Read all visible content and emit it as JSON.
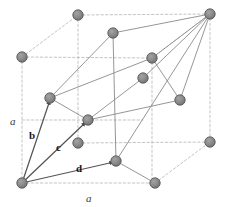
{
  "figure": {
    "type": "crystal-lattice-diagram",
    "background_color": "#ffffff",
    "cube_edge_color": "#b9b9b9",
    "cell_edge_color": "#8a8a8a",
    "vector_color": "#555555",
    "atom_fill_color": "#8a8a8a",
    "atom_edge_color": "#5a5a5a",
    "atom_radius_px": 5.2
  },
  "labels": {
    "vectors": [
      {
        "id": "b",
        "text": "b",
        "x": 29,
        "y": 130
      },
      {
        "id": "c",
        "text": "c",
        "x": 56,
        "y": 142
      },
      {
        "id": "d",
        "text": "d",
        "x": 76,
        "y": 163
      }
    ],
    "axes": [
      {
        "id": "a-left",
        "text": "a",
        "x": 10,
        "y": 116
      },
      {
        "id": "a-bottom",
        "text": "a",
        "x": 86,
        "y": 193
      }
    ]
  },
  "atoms": [
    {
      "id": "corner-back-bottom-left",
      "x": 22,
      "y": 183
    },
    {
      "id": "corner-back-top-left",
      "x": 22,
      "y": 57
    },
    {
      "id": "corner-top-back-mid",
      "x": 78,
      "y": 15
    },
    {
      "id": "corner-top-far-right",
      "x": 210,
      "y": 14
    },
    {
      "id": "corner-right-mid",
      "x": 210,
      "y": 142
    },
    {
      "id": "corner-bottom-front-mid",
      "x": 155,
      "y": 183
    },
    {
      "id": "face-center-upper-left",
      "x": 113,
      "y": 33
    },
    {
      "id": "face-center-upper-right",
      "x": 152,
      "y": 58
    },
    {
      "id": "face-center-mid-right",
      "x": 143,
      "y": 78
    },
    {
      "id": "face-center-left",
      "x": 50,
      "y": 98
    },
    {
      "id": "face-center-core",
      "x": 88,
      "y": 120
    },
    {
      "id": "face-center-inner",
      "x": 78,
      "y": 143
    },
    {
      "id": "face-center-lower-right",
      "x": 180,
      "y": 100
    },
    {
      "id": "face-center-bottom",
      "x": 116,
      "y": 161
    }
  ],
  "cube_edges": [
    {
      "id": "cube-left-vertical",
      "x1": 22,
      "y1": 57,
      "x2": 22,
      "y2": 183
    },
    {
      "id": "cube-left-to-back-top",
      "x1": 22,
      "y1": 57,
      "x2": 78,
      "y2": 15
    },
    {
      "id": "cube-back-top-vertical",
      "x1": 78,
      "y1": 15,
      "x2": 78,
      "y2": 143
    },
    {
      "id": "cube-back-top-to-far-top",
      "x1": 78,
      "y1": 15,
      "x2": 210,
      "y2": 14
    },
    {
      "id": "cube-far-top-vertical",
      "x1": 210,
      "y1": 14,
      "x2": 210,
      "y2": 142
    },
    {
      "id": "cube-left-to-mid-right",
      "x1": 22,
      "y1": 57,
      "x2": 152,
      "y2": 58
    },
    {
      "id": "cube-mid-right-diag",
      "x1": 152,
      "y1": 58,
      "x2": 210,
      "y2": 14
    },
    {
      "id": "cube-mid-right-vertical",
      "x1": 152,
      "y1": 58,
      "x2": 152,
      "y2": 183
    },
    {
      "id": "cube-bottom-front-edge",
      "x1": 22,
      "y1": 183,
      "x2": 155,
      "y2": 183
    },
    {
      "id": "cube-bottom-front-to-right",
      "x1": 155,
      "y1": 183,
      "x2": 210,
      "y2": 142
    },
    {
      "id": "cube-mid-horizontal-right",
      "x1": 78,
      "y1": 143,
      "x2": 210,
      "y2": 142
    },
    {
      "id": "cube-core-horizontal",
      "x1": 22,
      "y1": 120,
      "x2": 143,
      "y2": 120
    }
  ],
  "cell_edges": [
    {
      "id": "cell-b-to-upper-left",
      "x1": 50,
      "y1": 98,
      "x2": 113,
      "y2": 33
    },
    {
      "id": "cell-upper-left-to-top",
      "x1": 113,
      "y1": 33,
      "x2": 210,
      "y2": 14
    },
    {
      "id": "cell-b-to-core",
      "x1": 50,
      "y1": 98,
      "x2": 152,
      "y2": 58
    },
    {
      "id": "cell-core-to-top",
      "x1": 152,
      "y1": 58,
      "x2": 210,
      "y2": 14
    },
    {
      "id": "cell-c-to-midright",
      "x1": 88,
      "y1": 120,
      "x2": 180,
      "y2": 100
    },
    {
      "id": "cell-midright-to-top",
      "x1": 180,
      "y1": 100,
      "x2": 210,
      "y2": 14
    },
    {
      "id": "cell-d-to-bottomfront",
      "x1": 116,
      "y1": 161,
      "x2": 155,
      "y2": 183
    },
    {
      "id": "cell-bottomfront-up",
      "x1": 116,
      "y1": 161,
      "x2": 210,
      "y2": 14
    },
    {
      "id": "cell-upperleft-down",
      "x1": 113,
      "y1": 33,
      "x2": 116,
      "y2": 161
    },
    {
      "id": "cell-core-down",
      "x1": 152,
      "y1": 58,
      "x2": 180,
      "y2": 100
    },
    {
      "id": "cell-inner-link",
      "x1": 88,
      "y1": 120,
      "x2": 143,
      "y2": 78
    },
    {
      "id": "cell-inner-link-2",
      "x1": 143,
      "y1": 78,
      "x2": 210,
      "y2": 14
    },
    {
      "id": "cell-left-drop",
      "x1": 50,
      "y1": 98,
      "x2": 88,
      "y2": 120
    }
  ],
  "vectors": [
    {
      "id": "vector-b",
      "x1": 22,
      "y1": 183,
      "x2": 50,
      "y2": 100
    },
    {
      "id": "vector-c",
      "x1": 22,
      "y1": 183,
      "x2": 86,
      "y2": 122
    },
    {
      "id": "vector-d",
      "x1": 22,
      "y1": 183,
      "x2": 114,
      "y2": 162
    }
  ]
}
